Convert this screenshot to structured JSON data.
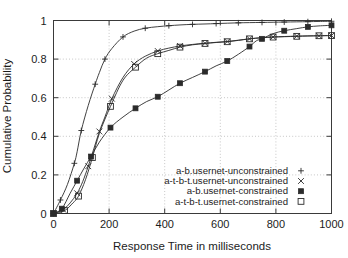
{
  "chart_data": {
    "type": "line",
    "title": "",
    "xlabel": "Response Time in milliseconds",
    "ylabel": "Cumulative Probability",
    "xlim": [
      0,
      1000
    ],
    "ylim": [
      0,
      1
    ],
    "xticks": [
      0,
      200,
      400,
      600,
      800,
      1000
    ],
    "yticks": [
      0,
      0.2,
      0.4,
      0.6,
      0.8,
      1
    ],
    "xtick_labels": [
      "0",
      "200",
      "400",
      "600",
      "800",
      "1000"
    ],
    "ytick_labels": [
      "0",
      "0.2",
      "0.4",
      "0.6",
      "0.8",
      "1"
    ],
    "grid": "both-dotted",
    "legend_position": "lower-right-inside",
    "series": [
      {
        "name": "a-b.usernet-unconstrained",
        "marker": "plus",
        "x": [
          0,
          25,
          50,
          75,
          85,
          100,
          125,
          150,
          165,
          185,
          210,
          250,
          290,
          330,
          375,
          415,
          455,
          500,
          545,
          585,
          625,
          665,
          705,
          750,
          790,
          830,
          875,
          915,
          955,
          1000
        ],
        "values": [
          0.0,
          0.07,
          0.15,
          0.26,
          0.32,
          0.43,
          0.56,
          0.67,
          0.73,
          0.8,
          0.855,
          0.915,
          0.945,
          0.96,
          0.968,
          0.973,
          0.977,
          0.98,
          0.982,
          0.984,
          0.986,
          0.988,
          0.989,
          0.99,
          0.991,
          0.992,
          0.993,
          0.994,
          0.995,
          0.996
        ]
      },
      {
        "name": "a-t-b-t.usernet-unconstrained",
        "marker": "cross",
        "x": [
          0,
          35,
          60,
          85,
          105,
          125,
          145,
          165,
          185,
          210,
          250,
          290,
          330,
          375,
          415,
          455,
          500,
          545,
          585,
          625,
          665,
          705,
          750,
          790,
          830,
          875,
          915,
          955,
          1000
        ],
        "values": [
          0.0,
          0.02,
          0.055,
          0.105,
          0.165,
          0.245,
          0.335,
          0.425,
          0.5,
          0.595,
          0.705,
          0.775,
          0.815,
          0.842,
          0.857,
          0.868,
          0.876,
          0.882,
          0.887,
          0.891,
          0.898,
          0.905,
          0.911,
          0.915,
          0.917,
          0.919,
          0.92,
          0.921,
          0.922
        ]
      },
      {
        "name": "a-b.usernet-constrained",
        "marker": "filled-square",
        "x": [
          0,
          30,
          60,
          85,
          110,
          135,
          165,
          205,
          250,
          295,
          335,
          375,
          415,
          455,
          500,
          545,
          585,
          625,
          665,
          705,
          730,
          750,
          790,
          830,
          875,
          915,
          955,
          1000
        ],
        "values": [
          0.0,
          0.025,
          0.105,
          0.17,
          0.235,
          0.295,
          0.37,
          0.445,
          0.5,
          0.545,
          0.58,
          0.605,
          0.64,
          0.675,
          0.705,
          0.735,
          0.765,
          0.79,
          0.825,
          0.865,
          0.895,
          0.905,
          0.932,
          0.947,
          0.958,
          0.967,
          0.972,
          0.975
        ]
      },
      {
        "name": "a-t-b-t.usernet-constrained",
        "marker": "open-square",
        "x": [
          0,
          40,
          70,
          90,
          115,
          140,
          165,
          205,
          250,
          295,
          335,
          375,
          415,
          455,
          500,
          545,
          585,
          625,
          665,
          705,
          750,
          790,
          830,
          875,
          915,
          955,
          1000
        ],
        "values": [
          0.0,
          0.015,
          0.055,
          0.09,
          0.175,
          0.29,
          0.415,
          0.555,
          0.69,
          0.758,
          0.805,
          0.828,
          0.845,
          0.862,
          0.874,
          0.881,
          0.886,
          0.89,
          0.897,
          0.905,
          0.911,
          0.914,
          0.916,
          0.918,
          0.92,
          0.921,
          0.922
        ]
      }
    ]
  }
}
